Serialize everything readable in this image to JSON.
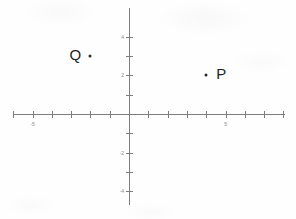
{
  "figure": {
    "title": "",
    "background_color": "#fefefe",
    "axis_color": "#7d7d7d",
    "point_color": "#2b2b2b",
    "label_color": "#8d8d8d",
    "width": 296,
    "height": 219
  },
  "chart_data": {
    "type": "scatter",
    "title": "",
    "xlabel": "",
    "ylabel": "",
    "xlim": [
      -6,
      8
    ],
    "ylim": [
      -5.5,
      5
    ],
    "grid": false,
    "legend": "none",
    "x_tick_values": [
      -6,
      -5,
      -4,
      -3,
      -2,
      -1,
      0,
      1,
      2,
      3,
      4,
      5,
      6,
      7,
      8
    ],
    "x_tick_labels": [
      "",
      "-5",
      "",
      "",
      "",
      "",
      "",
      "",
      "",
      "",
      "",
      "5",
      "",
      "",
      ""
    ],
    "y_tick_values": [
      4,
      3,
      2,
      1,
      -1,
      -2,
      -3,
      -4
    ],
    "y_tick_labels": [
      "4",
      "",
      "2",
      "",
      "",
      "-2",
      "",
      "-4"
    ],
    "points": [
      {
        "name": "Q",
        "x": -2,
        "y": 3,
        "label": "Q",
        "label_position": "left"
      },
      {
        "name": "P",
        "x": 4,
        "y": 2,
        "label": "P",
        "label_position": "right"
      }
    ]
  },
  "geometry": {
    "origin_x": 129,
    "origin_y": 114,
    "unit_px": 19.3,
    "x_axis_start": 13,
    "x_axis_end": 285,
    "y_axis_start": 8,
    "y_axis_end": 205
  }
}
